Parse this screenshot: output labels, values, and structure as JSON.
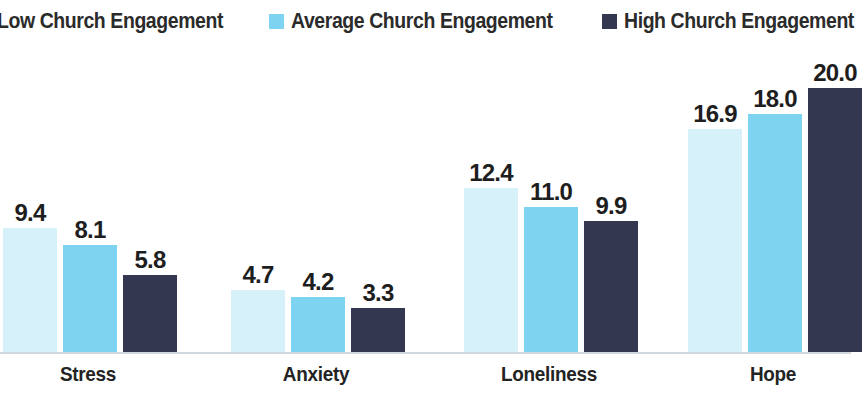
{
  "legend": {
    "items": [
      {
        "label": "Low Church Engagement",
        "color": "#d6f1fa",
        "key": "low"
      },
      {
        "label": "Average Church Engagement",
        "color": "#7dd3f0",
        "key": "average"
      },
      {
        "label": "High Church Engagement",
        "color": "#333850",
        "key": "high"
      }
    ]
  },
  "chart_data": {
    "type": "bar",
    "title": "",
    "subtitle": "",
    "xlabel": "",
    "ylabel": "",
    "grid": false,
    "legend_position": "top-center",
    "axis_visible": false,
    "baseline_color": "#c8d2da",
    "ylim": [
      0,
      20.0
    ],
    "categories": [
      "Stress",
      "Anxiety",
      "Loneliness",
      "Hope"
    ],
    "series": [
      {
        "name": "Low Church Engagement",
        "color": "#d6f1fa",
        "values": [
          9.4,
          4.7,
          12.4,
          16.9
        ]
      },
      {
        "name": "Average Church Engagement",
        "color": "#7dd3f0",
        "values": [
          8.1,
          4.2,
          11.0,
          18.0
        ]
      },
      {
        "name": "High Church Engagement",
        "color": "#333850",
        "values": [
          5.8,
          3.3,
          9.9,
          20.0
        ]
      }
    ],
    "value_labels": [
      [
        "9.4",
        "8.1",
        "5.8"
      ],
      [
        "4.7",
        "4.2",
        "3.3"
      ],
      [
        "12.4",
        "11.0",
        "9.9"
      ],
      [
        "16.9",
        "18.0",
        "20.0"
      ]
    ]
  },
  "geometry": {
    "baseline_y": 352,
    "px_per_unit": 13.2,
    "bar_width": 54,
    "group_starts": [
      3,
      231,
      464,
      688
    ],
    "bar_pitch": 60,
    "category_label_centers": [
      88,
      316,
      549,
      773
    ]
  }
}
